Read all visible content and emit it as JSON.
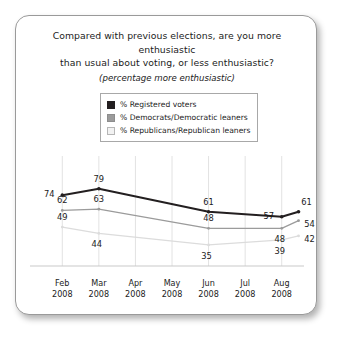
{
  "card": {
    "title_lines": [
      "Compared with previous elections, are you more enthusiastic",
      "than usual about voting, or less enthusiastic?"
    ],
    "subtitle": "(percentage more enthusiastic)"
  },
  "legend": {
    "items": [
      {
        "label": "% Registered voters",
        "color": "#231f20",
        "border": "#231f20"
      },
      {
        "label": "% Democrats/Democratic leaners",
        "color": "#9b9b9b",
        "border": "#8d8d8d"
      },
      {
        "label": "% Republicans/Republican leaners",
        "color": "#f2f2f2",
        "border": "#b6b6b6"
      }
    ]
  },
  "chart_data": {
    "type": "line",
    "title": "Compared with previous elections, are you more enthusiastic than usual about voting, or less enthusiastic?",
    "subtitle": "(percentage more enthusiastic)",
    "xlabel": "",
    "ylabel": "",
    "grid": "vertical",
    "legend_position": "top-center",
    "ylim": [
      0,
      100
    ],
    "categories": [
      "Feb 2008",
      "Mar 2008",
      "Apr 2008",
      "May 2008",
      "Jun 2008",
      "Jul 2008",
      "Aug 2008"
    ],
    "tick_labels": [
      {
        "month": "Feb",
        "year": "2008"
      },
      {
        "month": "Mar",
        "year": "2008"
      },
      {
        "month": "Apr",
        "year": "2008"
      },
      {
        "month": "May",
        "year": "2008"
      },
      {
        "month": "Jun",
        "year": "2008"
      },
      {
        "month": "Jul",
        "year": "2008"
      },
      {
        "month": "Aug",
        "year": "2008"
      }
    ],
    "series": [
      {
        "name": "% Registered voters",
        "color": "#231f20",
        "points": [
          {
            "x": "Feb 2008",
            "value": 74,
            "label_pos": "left"
          },
          {
            "x": "Mar 2008",
            "value": 79,
            "label_pos": "above"
          },
          {
            "x": "Jun 2008",
            "value": 61,
            "label_pos": "above"
          },
          {
            "x": "Aug 2008",
            "value": 57,
            "label_pos": "left"
          },
          {
            "x": "late Aug 2008",
            "value": 61,
            "label_pos": "above-right"
          }
        ]
      },
      {
        "name": "% Democrats/Democratic leaners",
        "color": "#9b9b9b",
        "points": [
          {
            "x": "Feb 2008",
            "value": 62,
            "label_pos": "above"
          },
          {
            "x": "Mar 2008",
            "value": 63,
            "label_pos": "above"
          },
          {
            "x": "Jun 2008",
            "value": 48,
            "label_pos": "above"
          },
          {
            "x": "Aug 2008",
            "value": 48,
            "label_pos": "below"
          },
          {
            "x": "late Aug 2008",
            "value": 54,
            "label_pos": "right"
          }
        ]
      },
      {
        "name": "% Republicans/Republican leaners",
        "color": "#dcdcdc",
        "points": [
          {
            "x": "Feb 2008",
            "value": 49,
            "label_pos": "above"
          },
          {
            "x": "Mar 2008",
            "value": 44,
            "label_pos": "below"
          },
          {
            "x": "Jun 2008",
            "value": 35,
            "label_pos": "below"
          },
          {
            "x": "Aug 2008",
            "value": 39,
            "label_pos": "below"
          },
          {
            "x": "late Aug 2008",
            "value": 42,
            "label_pos": "right"
          }
        ]
      }
    ]
  }
}
